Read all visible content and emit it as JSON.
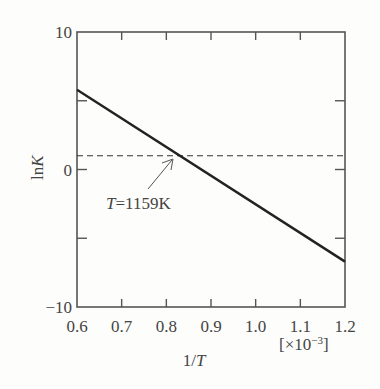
{
  "chart_data": {
    "type": "line",
    "title": "",
    "xlabel": "1/T",
    "x_unit": "[×10⁻³]",
    "ylabel": "lnK",
    "xlim": [
      0.6,
      1.2
    ],
    "ylim": [
      -10,
      10
    ],
    "x_ticks": [
      "0.6",
      "0.7",
      "0.8",
      "0.9",
      "1.0",
      "1.1",
      "1.2"
    ],
    "y_ticks": [
      "10",
      "0",
      "−10"
    ],
    "series": [
      {
        "name": "lnK",
        "style": "solid",
        "x": [
          0.6,
          1.2
        ],
        "values": [
          5.8,
          -6.7
        ]
      },
      {
        "name": "lnK = 1",
        "style": "dashed",
        "x": [
          0.6,
          1.2
        ],
        "values": [
          1.0,
          1.0
        ]
      }
    ],
    "annotations": [
      {
        "text": "T=1159K",
        "x": 0.8628,
        "y": 1.0,
        "arrow": true
      }
    ],
    "grid": false,
    "legend": null
  },
  "labels": {
    "annotation": "T=1159K",
    "annotation_T": "T",
    "annotation_rest": "=1159K",
    "xlabel_prefix": "1/",
    "xlabel_T": "T",
    "x_unit": "[×10",
    "x_unit_exp": "−3",
    "x_unit_close": "]",
    "ylabel_ln": "ln",
    "ylabel_K": "K"
  }
}
